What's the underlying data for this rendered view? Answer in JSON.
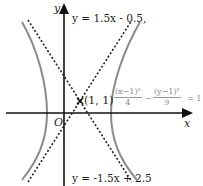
{
  "diagram": {
    "axes": {
      "x_label": "x",
      "y_label": "y",
      "origin_label": "O"
    },
    "center_point": {
      "label": "(1, 1)",
      "x": 1,
      "y": 1
    },
    "asymptotes": [
      {
        "label": "y = 1.5x - 0.5,",
        "slope": 1.5,
        "intercept": -0.5,
        "style": "dashed"
      },
      {
        "label": "y = -1.5x + 2.5",
        "slope": -1.5,
        "intercept": 2.5,
        "style": "dashed"
      }
    ],
    "hyperbola": {
      "equation_parts": {
        "term1_num": "(x−1)²",
        "term1_den": "4",
        "minus": "−",
        "term2_num": "(y−1)²",
        "term2_den": "9",
        "equals": "= 1"
      },
      "color": "#8a8a8a"
    },
    "colors": {
      "axis": "#111111",
      "asymptote": "#222222",
      "curve": "#8a8a8a"
    }
  }
}
